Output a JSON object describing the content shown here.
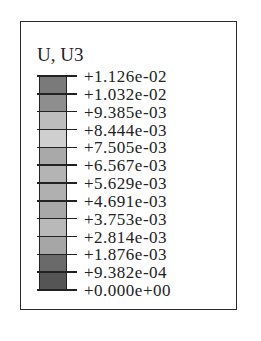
{
  "legend": {
    "title": "U, U3",
    "labels": [
      "+1.126e-02",
      "+1.032e-02",
      "+9.385e-03",
      "+8.444e-03",
      "+7.505e-03",
      "+6.567e-03",
      "+5.629e-03",
      "+4.691e-03",
      "+3.753e-03",
      "+2.814e-03",
      "+1.876e-03",
      "+9.382e-04",
      "+0.000e+00"
    ],
    "bin_colors": [
      "#7a7a7a",
      "#8e8e8e",
      "#bdbdbd",
      "#cfcfcf",
      "#a9a9a9",
      "#b4b4b4",
      "#b0b0b0",
      "#a8a8a8",
      "#b9b9b9",
      "#a6a6a6",
      "#6a6a6a",
      "#555555"
    ]
  }
}
